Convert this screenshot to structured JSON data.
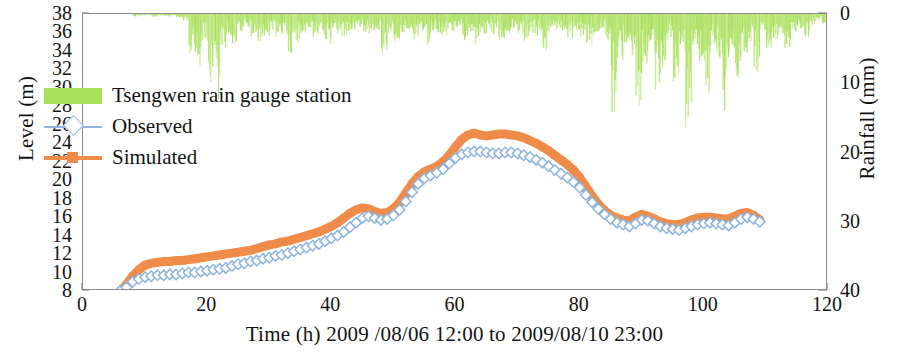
{
  "chart_data": {
    "type": "line",
    "title": "",
    "xlabel": "Time (h) 2009 /08/06 12:00 to 2009/08/10 23:00",
    "ylabel": "Level (m)",
    "y2label": "Rainfall (mm)",
    "xlim": [
      0,
      120
    ],
    "xticks": [
      0,
      20,
      40,
      60,
      80,
      100,
      120
    ],
    "ylim": [
      8,
      38
    ],
    "yticks": [
      8,
      10,
      12,
      14,
      16,
      18,
      20,
      22,
      24,
      26,
      28,
      30,
      32,
      34,
      36,
      38
    ],
    "y2lim": [
      40,
      0
    ],
    "y2ticks": [
      0,
      10,
      20,
      30,
      40
    ],
    "y2_inverted": true,
    "grid": false,
    "legend_position": "upper-left",
    "colors": {
      "rainfall": "#a8e05a",
      "observed": "#8fb4dd",
      "simulated": "#f08c4a",
      "axis": "#8a8a8a",
      "text": "#141414"
    },
    "series": [
      {
        "name": "Tsengwen rain gauge station",
        "type": "bar",
        "axis": "y2",
        "marker": "none",
        "x": [
          0,
          1,
          2,
          3,
          4,
          5,
          6,
          7,
          8,
          9,
          10,
          11,
          12,
          13,
          14,
          15,
          16,
          17,
          18,
          19,
          20,
          21,
          22,
          23,
          24,
          25,
          26,
          27,
          28,
          29,
          30,
          31,
          32,
          33,
          34,
          35,
          36,
          37,
          38,
          39,
          40,
          41,
          42,
          43,
          44,
          45,
          46,
          47,
          48,
          49,
          50,
          51,
          52,
          53,
          54,
          55,
          56,
          57,
          58,
          59,
          60,
          61,
          62,
          63,
          64,
          65,
          66,
          67,
          68,
          69,
          70,
          71,
          72,
          73,
          74,
          75,
          76,
          77,
          78,
          79,
          80,
          81,
          82,
          83,
          84,
          85,
          86,
          87,
          88,
          89,
          90,
          91,
          92,
          93,
          94,
          95,
          96,
          97,
          98,
          99,
          100,
          101,
          102,
          103,
          104,
          105,
          106,
          107,
          108,
          109,
          110,
          111,
          112,
          113,
          114,
          115,
          116,
          117,
          118,
          119,
          120
        ],
        "values": [
          0,
          0,
          0,
          0,
          0,
          0,
          0,
          0,
          0.3,
          0.2,
          0.1,
          0.4,
          0.2,
          0.3,
          0.2,
          0.4,
          0.8,
          4.6,
          6.2,
          3.1,
          7.6,
          9.6,
          4.2,
          2.5,
          3.4,
          2.1,
          1.5,
          2.6,
          3.3,
          2.4,
          1.8,
          3.0,
          2.4,
          5.8,
          3.1,
          2.2,
          1.6,
          2.8,
          2.4,
          3.6,
          1.9,
          2.6,
          3.4,
          2.1,
          1.5,
          2.4,
          3.2,
          2.0,
          5.2,
          2.6,
          3.8,
          2.2,
          1.7,
          2.9,
          2.3,
          3.7,
          2.0,
          2.6,
          3.1,
          2.2,
          1.8,
          2.9,
          2.4,
          3.4,
          2.6,
          2.0,
          2.8,
          3.2,
          2.2,
          1.6,
          2.4,
          3.0,
          2.2,
          2.6,
          4.0,
          2.4,
          1.8,
          2.6,
          3.2,
          2.2,
          2.8,
          3.6,
          2.4,
          1.9,
          3.0,
          11.6,
          6.2,
          3.4,
          4.8,
          12.4,
          5.6,
          3.2,
          8.8,
          6.6,
          3.0,
          10.4,
          5.2,
          12.8,
          4.4,
          6.0,
          9.2,
          3.6,
          5.4,
          11.0,
          4.2,
          7.8,
          5.0,
          3.4,
          6.4,
          2.8,
          4.6,
          3.2,
          2.4,
          3.8,
          2.2,
          1.6,
          2.8,
          1.4,
          0.8,
          1.2,
          0.4
        ]
      },
      {
        "name": "Observed",
        "type": "line",
        "axis": "y1",
        "marker": "diamond",
        "x": [
          6,
          7,
          8,
          9,
          10,
          11,
          12,
          13,
          14,
          15,
          16,
          17,
          18,
          19,
          20,
          21,
          22,
          23,
          24,
          25,
          26,
          27,
          28,
          29,
          30,
          31,
          32,
          33,
          34,
          35,
          36,
          37,
          38,
          39,
          40,
          41,
          42,
          43,
          44,
          45,
          46,
          47,
          48,
          49,
          50,
          51,
          52,
          53,
          54,
          55,
          56,
          57,
          58,
          59,
          60,
          61,
          62,
          63,
          64,
          65,
          66,
          67,
          68,
          69,
          70,
          71,
          72,
          73,
          74,
          75,
          76,
          77,
          78,
          79,
          80,
          81,
          82,
          83,
          84,
          85,
          86,
          87,
          88,
          89,
          90,
          91,
          92,
          93,
          94,
          95,
          96,
          97,
          98,
          99,
          100,
          101,
          102,
          103,
          104,
          105,
          106,
          107,
          108,
          109
        ],
        "values": [
          8.0,
          8.4,
          9.0,
          9.3,
          9.5,
          9.6,
          9.7,
          9.7,
          9.8,
          9.8,
          9.9,
          10.0,
          10.0,
          10.1,
          10.2,
          10.3,
          10.4,
          10.5,
          10.7,
          10.9,
          11.0,
          11.2,
          11.3,
          11.5,
          11.6,
          11.8,
          11.9,
          12.1,
          12.3,
          12.5,
          12.7,
          12.9,
          13.1,
          13.4,
          13.7,
          14.0,
          14.4,
          14.9,
          15.4,
          15.9,
          16.1,
          15.9,
          15.7,
          15.8,
          16.2,
          16.8,
          17.7,
          18.7,
          19.6,
          20.2,
          20.5,
          20.8,
          21.2,
          21.8,
          22.4,
          22.8,
          23.0,
          23.1,
          23.1,
          23.0,
          22.9,
          22.9,
          23.0,
          23.0,
          22.9,
          22.7,
          22.5,
          22.2,
          21.9,
          21.5,
          21.1,
          20.7,
          20.3,
          19.8,
          19.2,
          18.4,
          17.6,
          16.9,
          16.3,
          15.8,
          15.4,
          15.2,
          15.0,
          15.3,
          15.7,
          15.6,
          15.3,
          15.0,
          14.8,
          14.7,
          14.6,
          14.8,
          15.0,
          15.2,
          15.3,
          15.4,
          15.3,
          15.2,
          15.1,
          15.4,
          15.8,
          16.0,
          15.8,
          15.5
        ]
      },
      {
        "name": "Simulated",
        "type": "line",
        "axis": "y1",
        "marker": "square",
        "x": [
          6,
          7,
          8,
          9,
          10,
          11,
          12,
          13,
          14,
          15,
          16,
          17,
          18,
          19,
          20,
          21,
          22,
          23,
          24,
          25,
          26,
          27,
          28,
          29,
          30,
          31,
          32,
          33,
          34,
          35,
          36,
          37,
          38,
          39,
          40,
          41,
          42,
          43,
          44,
          45,
          46,
          47,
          48,
          49,
          50,
          51,
          52,
          53,
          54,
          55,
          56,
          57,
          58,
          59,
          60,
          61,
          62,
          63,
          64,
          65,
          66,
          67,
          68,
          69,
          70,
          71,
          72,
          73,
          74,
          75,
          76,
          77,
          78,
          79,
          80,
          81,
          82,
          83,
          84,
          85,
          86,
          87,
          88,
          89,
          90,
          91,
          92,
          93,
          94,
          95,
          96,
          97,
          98,
          99,
          100,
          101,
          102,
          103,
          104,
          105,
          106,
          107,
          108,
          109
        ],
        "values": [
          8.0,
          8.7,
          9.6,
          10.3,
          10.8,
          11.0,
          11.1,
          11.2,
          11.2,
          11.3,
          11.3,
          11.4,
          11.5,
          11.6,
          11.7,
          11.8,
          11.9,
          12.0,
          12.1,
          12.2,
          12.3,
          12.4,
          12.6,
          12.8,
          13.0,
          13.1,
          13.3,
          13.4,
          13.6,
          13.8,
          14.0,
          14.2,
          14.4,
          14.7,
          15.0,
          15.4,
          15.9,
          16.4,
          16.8,
          17.0,
          16.9,
          16.6,
          16.4,
          16.5,
          16.9,
          17.6,
          18.6,
          19.6,
          20.4,
          20.9,
          21.2,
          21.5,
          22.0,
          22.7,
          23.6,
          24.4,
          24.9,
          25.1,
          24.9,
          24.8,
          24.9,
          25.0,
          25.0,
          24.9,
          24.8,
          24.6,
          24.3,
          24.0,
          23.6,
          23.2,
          22.7,
          22.2,
          21.7,
          21.1,
          20.3,
          19.3,
          18.3,
          17.4,
          16.7,
          16.2,
          15.9,
          15.7,
          15.6,
          16.0,
          16.3,
          16.1,
          15.8,
          15.5,
          15.3,
          15.2,
          15.2,
          15.4,
          15.7,
          15.9,
          16.0,
          16.0,
          15.9,
          15.8,
          15.8,
          16.1,
          16.4,
          16.5,
          16.2,
          15.7
        ]
      }
    ]
  },
  "legend": {
    "items": [
      {
        "label": "Tsengwen rain gauge station",
        "key": "green-swatch"
      },
      {
        "label": "Observed",
        "key": "blue-diamond-line"
      },
      {
        "label": "Simulated",
        "key": "orange-square-line"
      }
    ]
  },
  "axes": {
    "left_title": "Level (m)",
    "right_title": "Rainfall (mm)",
    "bottom_title": "Time (h) 2009 /08/06 12:00 to 2009/08/10 23:00",
    "left_ticks": [
      "38",
      "36",
      "34",
      "32",
      "30",
      "28",
      "26",
      "24",
      "22",
      "20",
      "18",
      "16",
      "14",
      "12",
      "10",
      "8"
    ],
    "right_ticks": [
      "0",
      "10",
      "20",
      "30",
      "40"
    ],
    "bottom_ticks": [
      "0",
      "20",
      "40",
      "60",
      "80",
      "100",
      "120"
    ]
  }
}
